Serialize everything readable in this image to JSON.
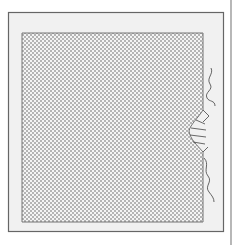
{
  "diagram": {
    "type": "patent-style line drawing",
    "colors": {
      "background": "#ffffff",
      "frame_fill": "#f2f2f2",
      "stroke": "#555555",
      "stipple": "#666666"
    },
    "elements": [
      {
        "name": "outer-frame",
        "x": 8,
        "y": 12,
        "w": 216,
        "h": 220
      },
      {
        "name": "stippled-panel",
        "x": 22,
        "y": 33,
        "w": 181,
        "h": 189
      },
      {
        "name": "right-edge-bulge",
        "y_start": 110,
        "y_end": 152
      },
      {
        "name": "wavy-line-upper",
        "x": 205,
        "y_start": 68,
        "y_end": 106
      },
      {
        "name": "wavy-line-lower",
        "x": 208,
        "y_start": 158,
        "y_end": 200
      },
      {
        "name": "vertical-rule",
        "x": 231
      }
    ]
  }
}
